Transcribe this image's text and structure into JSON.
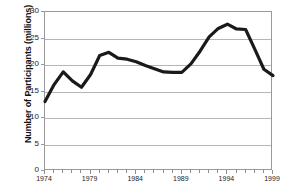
{
  "chart_data": {
    "type": "line",
    "title": "",
    "xlabel": "",
    "ylabel": "Number of Participants (millions)",
    "xlim": [
      1974,
      1999
    ],
    "ylim": [
      0,
      30
    ],
    "grid": true,
    "legend": false,
    "line_color": "#1a1a1a",
    "x": [
      1974,
      1975,
      1976,
      1977,
      1978,
      1979,
      1980,
      1981,
      1982,
      1983,
      1984,
      1985,
      1986,
      1987,
      1988,
      1989,
      1990,
      1991,
      1992,
      1993,
      1994,
      1995,
      1996,
      1997,
      1998,
      1999
    ],
    "values": [
      13.1,
      16.3,
      18.7,
      17.0,
      15.8,
      18.2,
      21.8,
      22.4,
      21.3,
      21.1,
      20.6,
      19.9,
      19.3,
      18.7,
      18.6,
      18.6,
      20.2,
      22.6,
      25.3,
      26.9,
      27.7,
      26.8,
      26.7,
      23.0,
      19.2,
      18.0
    ],
    "y_ticks": [
      0,
      5,
      10,
      15,
      20,
      25,
      30
    ],
    "x_ticks": [
      1974,
      1979,
      1984,
      1989,
      1994,
      1999
    ],
    "x_minor_tick_step": 1
  },
  "axes": {
    "y_tick_labels": [
      "0",
      "5",
      "10",
      "15",
      "20",
      "25",
      "30"
    ],
    "x_tick_labels": [
      "1974",
      "1979",
      "1984",
      "1989",
      "1994",
      "1999"
    ]
  }
}
